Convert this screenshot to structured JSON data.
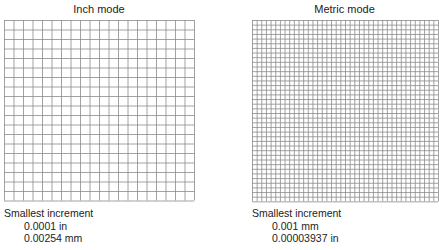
{
  "panels": [
    {
      "title": "Inch mode",
      "grid": {
        "cols": 20,
        "rows": 19,
        "cell_px": 9.5
      },
      "increment_label": "Smallest increment",
      "values": [
        "0.0001 in",
        "0.00254 mm"
      ]
    },
    {
      "title": "Metric mode",
      "grid": {
        "cols": 40,
        "rows": 39,
        "cell_px": 4.65
      },
      "increment_label": "Smallest increment",
      "values": [
        "0.001 mm",
        "0.00003937 in"
      ]
    }
  ],
  "colors": {
    "grid_line": "#8a8a8a",
    "text": "#222222",
    "background": "#ffffff"
  }
}
